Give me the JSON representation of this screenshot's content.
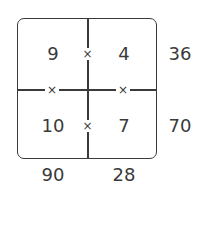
{
  "grid": {
    "cells": [
      {
        "row": 0,
        "col": 0,
        "value": "9"
      },
      {
        "row": 0,
        "col": 1,
        "value": "4"
      },
      {
        "row": 1,
        "col": 0,
        "value": "10"
      },
      {
        "row": 1,
        "col": 1,
        "value": "7"
      }
    ],
    "operator": "×",
    "row_products": [
      "36",
      "70"
    ],
    "col_products": [
      "90",
      "28"
    ]
  }
}
